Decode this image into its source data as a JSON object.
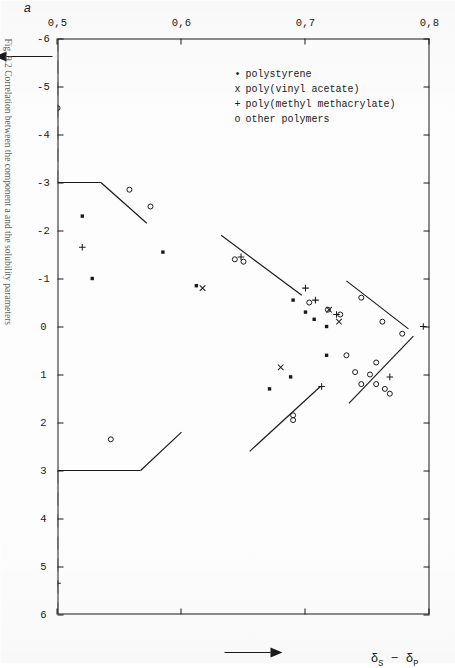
{
  "figure": {
    "caption": "Fig. 9.2  Correlation between the component a and the solubility parameters"
  },
  "axes": {
    "x_title_html": "&delta;<sub>S</sub> &minus; &delta;<sub>P</sub>",
    "x_title_text": "δS − δP",
    "y_title_text": "a",
    "x_arrow": "arrow-right",
    "y_arrow": "arrow-up"
  },
  "legend": {
    "items": [
      {
        "symbol": "•",
        "symbol_name": "filled-square-marker",
        "label": "polystyrene"
      },
      {
        "symbol": "x",
        "symbol_name": "cross-marker",
        "label": "poly(vinyl acetate)"
      },
      {
        "symbol": "+",
        "symbol_name": "plus-marker",
        "label": "poly(methyl methacrylate)"
      },
      {
        "symbol": "o",
        "symbol_name": "open-circle-marker",
        "label": "other polymers"
      }
    ]
  },
  "chart_data": {
    "type": "scatter",
    "title": "",
    "xlabel": "δS − δP",
    "ylabel": "a",
    "xlim": [
      -6,
      6
    ],
    "ylim": [
      0.5,
      0.8
    ],
    "grid": false,
    "legend_position": "upper-left",
    "xticks": [
      -6,
      -5,
      -4,
      -3,
      -2,
      -1,
      0,
      1,
      2,
      3,
      4,
      5,
      6
    ],
    "xticklabels": [
      "-6",
      "-5",
      "-4",
      "-3",
      "-2",
      "-1",
      "0",
      "1",
      "2",
      "3",
      "4",
      "5",
      "6"
    ],
    "yticks": [
      0.5,
      0.6,
      0.7,
      0.8
    ],
    "yticklabels": [
      "0,5",
      "0,6",
      "0,7",
      "0,8"
    ],
    "series": [
      {
        "name": "polystyrene",
        "marker": "filled-square",
        "points": [
          [
            0.0,
            0.717
          ],
          [
            -0.15,
            0.707
          ],
          [
            -0.3,
            0.7
          ],
          [
            -0.55,
            0.69
          ],
          [
            0.6,
            0.717
          ],
          [
            1.05,
            0.688
          ],
          [
            1.3,
            0.671
          ],
          [
            -0.85,
            0.612
          ],
          [
            -1.55,
            0.585
          ],
          [
            -1.0,
            0.528
          ],
          [
            -2.3,
            0.52
          ]
        ]
      },
      {
        "name": "poly(vinyl acetate)",
        "marker": "cross",
        "points": [
          [
            -0.1,
            0.727
          ],
          [
            -0.35,
            0.719
          ],
          [
            0.85,
            0.68
          ],
          [
            -0.8,
            0.617
          ]
        ]
      },
      {
        "name": "poly(methyl methacrylate)",
        "marker": "plus",
        "points": [
          [
            0.0,
            0.795
          ],
          [
            1.05,
            0.768
          ],
          [
            -0.25,
            0.725
          ],
          [
            -0.55,
            0.708
          ],
          [
            -0.8,
            0.7
          ],
          [
            -1.45,
            0.648
          ],
          [
            1.25,
            0.713
          ],
          [
            5.35,
            0.5
          ],
          [
            -1.65,
            0.52
          ]
        ]
      },
      {
        "name": "other polymers",
        "marker": "open-circle",
        "points": [
          [
            0.15,
            0.778
          ],
          [
            -0.1,
            0.762
          ],
          [
            -0.6,
            0.745
          ],
          [
            -0.25,
            0.728
          ],
          [
            0.6,
            0.733
          ],
          [
            0.75,
            0.757
          ],
          [
            1.0,
            0.752
          ],
          [
            0.95,
            0.74
          ],
          [
            1.2,
            0.757
          ],
          [
            1.2,
            0.745
          ],
          [
            1.3,
            0.764
          ],
          [
            1.4,
            0.768
          ],
          [
            1.85,
            0.69
          ],
          [
            1.95,
            0.69
          ],
          [
            -0.35,
            0.718
          ],
          [
            -0.5,
            0.703
          ],
          [
            -1.35,
            0.65
          ],
          [
            -1.4,
            0.643
          ],
          [
            2.35,
            0.543
          ],
          [
            -2.5,
            0.575
          ],
          [
            -2.85,
            0.558
          ],
          [
            -4.55,
            0.5
          ]
        ]
      }
    ],
    "trend_lines": [
      {
        "name": "upper-right-branch",
        "from": [
          0.2,
          0.787
        ],
        "to": [
          1.6,
          0.735
        ],
        "style": "solid"
      },
      {
        "name": "mid-right-branch",
        "from": [
          1.25,
          0.712
        ],
        "to": [
          2.6,
          0.655
        ],
        "style": "solid"
      },
      {
        "name": "lower-right-branch",
        "from": [
          2.2,
          0.6
        ],
        "to": [
          3.0,
          0.567
        ],
        "style": "solid"
      },
      {
        "name": "right-drop",
        "from": [
          3.0,
          0.567
        ],
        "to": [
          3.0,
          0.5
        ],
        "style": "solid"
      },
      {
        "name": "upper-left-branch",
        "from": [
          0.05,
          0.783
        ],
        "to": [
          -0.95,
          0.733
        ],
        "style": "solid"
      },
      {
        "name": "mid-left-branch",
        "from": [
          -0.65,
          0.697
        ],
        "to": [
          -1.9,
          0.632
        ],
        "style": "solid"
      },
      {
        "name": "lower-left-branch",
        "from": [
          -2.15,
          0.572
        ],
        "to": [
          -3.0,
          0.535
        ],
        "style": "solid"
      },
      {
        "name": "left-drop",
        "from": [
          -3.0,
          0.535
        ],
        "to": [
          -3.0,
          0.5
        ],
        "style": "solid"
      }
    ],
    "baselines": [
      {
        "name": "left-baseline",
        "from": [
          -6.0,
          0.5
        ],
        "to": [
          -3.0,
          0.5
        ],
        "style": "dashed"
      },
      {
        "name": "right-baseline",
        "from": [
          3.0,
          0.5
        ],
        "to": [
          6.0,
          0.5
        ],
        "style": "dashed"
      }
    ]
  }
}
